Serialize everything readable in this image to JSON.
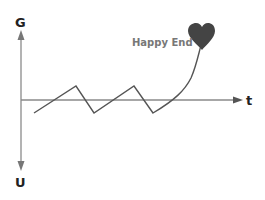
{
  "diagram": {
    "y_axis_top_label": "G",
    "y_axis_bottom_label": "U",
    "x_axis_label": "t",
    "annotation": "Happy End",
    "annotation_icon": "heart-icon",
    "colors": {
      "axis": "#8a8a8a",
      "line": "#555555",
      "heart": "#444444",
      "annotation_text": "#777777",
      "label_text": "#222222"
    }
  }
}
